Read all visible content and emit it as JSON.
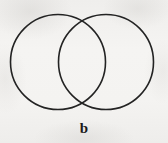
{
  "figure": {
    "label": "b",
    "caption_label": "b",
    "type": "venn-diagram",
    "background_color": "#f3f2f0",
    "stroke_color": "#232323",
    "stroke_width": 1.6,
    "fill": "none"
  },
  "chart_data": {
    "type": "diagram",
    "title": "b",
    "sets": [
      {
        "name": "left-circle",
        "center_x": 58,
        "center_y": 62,
        "radius": 47.5,
        "fill": "none",
        "stroke": "#232323"
      },
      {
        "name": "right-circle",
        "center_x": 106,
        "center_y": 62,
        "radius": 47.5,
        "fill": "none",
        "stroke": "#232323"
      }
    ],
    "intersection": {
      "label": "",
      "top_crossing_x": 82,
      "top_crossing_y": 14,
      "bottom_crossing_x": 82,
      "bottom_crossing_y": 110
    },
    "xlabel": "",
    "ylabel": "",
    "legend": []
  }
}
